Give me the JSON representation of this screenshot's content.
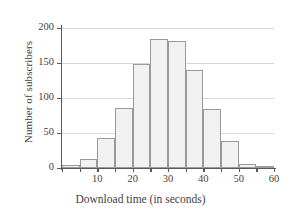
{
  "chart_data": {
    "type": "bar",
    "title": "",
    "xlabel": "Download time (in seconds)",
    "ylabel": "Number of subscribers",
    "categories": [
      "0-5",
      "5-10",
      "10-15",
      "15-20",
      "20-25",
      "25-30",
      "30-35",
      "35-40",
      "40-45",
      "45-50",
      "50-55",
      "55-60"
    ],
    "bin_starts": [
      0,
      5,
      10,
      15,
      20,
      25,
      30,
      35,
      40,
      45,
      50,
      55
    ],
    "bin_width": 5,
    "values": [
      5,
      13,
      43,
      86,
      148,
      185,
      181,
      140,
      84,
      39,
      6,
      2
    ],
    "xlim": [
      0,
      60
    ],
    "ylim": [
      0,
      200
    ],
    "x_ticks": [
      10,
      20,
      30,
      40,
      50,
      60
    ],
    "x_tick_labels": [
      "10",
      "20",
      "30",
      "40",
      "50",
      "60"
    ],
    "y_ticks": [
      0,
      50,
      100,
      150,
      200
    ],
    "y_tick_labels": [
      "0",
      "50",
      "100",
      "150",
      "200"
    ],
    "grid": true,
    "grid_axis": "y",
    "legend": null,
    "bar_fill_color": "#f1f1f1",
    "bar_edge_color": "#9a9a9a",
    "gridline_color": "#d8d8d8",
    "axis_color": "#5a5a5a"
  }
}
